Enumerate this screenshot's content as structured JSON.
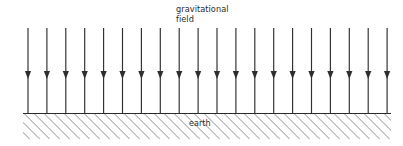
{
  "figure": {
    "field_label_line1": "gravitational",
    "field_label_line2": "field",
    "earth_label": "earth",
    "colors": {
      "arrow": "#2e2e2e",
      "ground_line": "#2b2b2b",
      "hatch": "#9a9a9a",
      "text": "#2b2b2b",
      "background": "#ffffff"
    }
  },
  "chart_data": {
    "type": "diagram",
    "arrow_count": 20,
    "arrow_direction": "down",
    "arrow_x_positions": [
      28,
      46.9,
      65.8,
      84.7,
      103.6,
      122.5,
      141.4,
      160.3,
      179.2,
      198.1,
      217,
      235.9,
      254.8,
      273.7,
      292.6,
      311.5,
      330.4,
      349.3,
      368.2,
      387.1
    ],
    "arrow_top_y": 28,
    "arrow_bottom_y": 113,
    "arrowhead_tip_y": 79,
    "arrowhead_top_y": 71,
    "arrowhead_half_width": 3.1,
    "ground_line_y": 113,
    "ground_x_start": 23,
    "ground_x_end": 391,
    "hatch_band_top": 113,
    "hatch_band_bottom": 139,
    "hatch_angle_deg": 45,
    "hatch_spacing_px": 5,
    "labels": [
      {
        "text": "gravitational field",
        "x": 176,
        "y": 5,
        "anchor": "start"
      },
      {
        "text": "earth",
        "x": 189,
        "y": 119,
        "anchor": "start"
      }
    ]
  }
}
